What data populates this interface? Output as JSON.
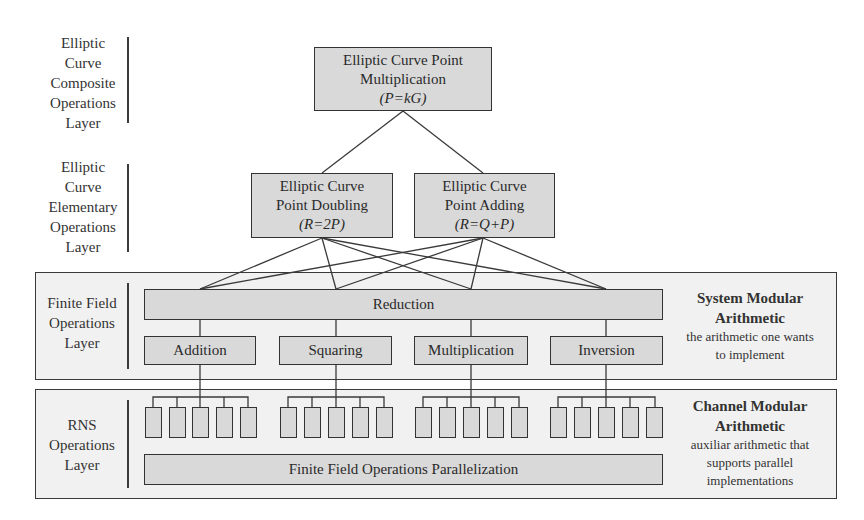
{
  "layers": {
    "composite": "Elliptic Curve Composite Operations Layer",
    "elementary": "Elliptic Curve Elementary Operations Layer",
    "finite_field": "Finite Field Operations Layer",
    "rns": "RNS Operations Layer"
  },
  "layer_lines": {
    "composite": [
      "Elliptic",
      "Curve",
      "Composite",
      "Operations",
      "Layer"
    ],
    "elementary": [
      "Elliptic",
      "Curve",
      "Elementary",
      "Operations",
      "Layer"
    ],
    "finite_field": [
      "Finite Field",
      "Operations",
      "Layer"
    ],
    "rns": [
      "RNS",
      "Operations",
      "Layer"
    ]
  },
  "nodes": {
    "point_multiplication": {
      "line1": "Elliptic Curve Point",
      "line2": "Multiplication",
      "formula": "(P=kG)"
    },
    "point_doubling": {
      "line1": "Elliptic Curve",
      "line2": "Point Doubling",
      "formula": "(R=2P)"
    },
    "point_adding": {
      "line1": "Elliptic Curve",
      "line2": "Point Adding",
      "formula": "(R=Q+P)"
    },
    "reduction": "Reduction",
    "addition": "Addition",
    "squaring": "Squaring",
    "multiplication": "Multiplication",
    "inversion": "Inversion",
    "parallelization": "Finite Field Operations Parallelization"
  },
  "rns_channels_per_operation": 5,
  "annotations": {
    "system": {
      "title1": "System Modular",
      "title2": "Arithmetic",
      "desc1": "the arithmetic one wants",
      "desc2": "to implement"
    },
    "channel": {
      "title1": "Channel Modular",
      "title2": "Arithmetic",
      "desc1": "auxiliar arithmetic that",
      "desc2": "supports parallel",
      "desc3": "implementations"
    }
  },
  "colors": {
    "box_fill": "#d9d9d9",
    "panel_fill": "#f1f1f1",
    "stroke": "#333333"
  }
}
